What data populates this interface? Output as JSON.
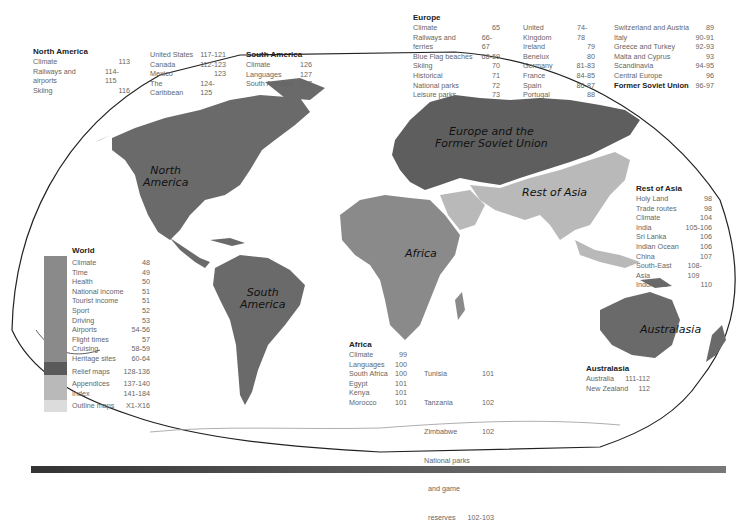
{
  "colors": {
    "region_dark": "#6a6a6a",
    "region_mid": "#8a8a8a",
    "region_light": "#b9b9b9",
    "region_pale": "#d8d8d8",
    "outline": "#222222"
  },
  "map_labels": {
    "north_america": [
      "North",
      "America"
    ],
    "south_america": [
      "South",
      "America"
    ],
    "europe": [
      "Europe and the",
      "Former Soviet Union"
    ],
    "rest_of_asia": "Rest of Asia",
    "africa": "Africa",
    "australasia": "Australasia"
  },
  "north_america": {
    "title": "North America",
    "col1": [
      {
        "label": "Climate",
        "pages": "113"
      },
      {
        "label": "Railways and airports",
        "pages": "114-115"
      },
      {
        "label": "Skiing",
        "pages": "116"
      }
    ],
    "col2": [
      {
        "label": "United States",
        "pages": "117-121"
      },
      {
        "label": "Canada",
        "pages": "112-123"
      },
      {
        "label": "Mexico",
        "pages": "123"
      },
      {
        "label": "The Caribbean",
        "pages": "124-125"
      }
    ]
  },
  "south_america": {
    "title": "South America",
    "items": [
      {
        "label": "Climate",
        "pages": "126"
      },
      {
        "label": "Languages",
        "pages": "127"
      },
      {
        "label": "South America",
        "pages": "127"
      }
    ]
  },
  "europe": {
    "title": "Europe",
    "col1": [
      {
        "label": "Climate",
        "pages": "65"
      },
      {
        "label": "Railways and ferries",
        "pages": "66-67"
      },
      {
        "label": "Blue Flag beaches",
        "pages": "68-69"
      },
      {
        "label": "Skiing",
        "pages": "70"
      },
      {
        "label": "Historical",
        "pages": "71"
      },
      {
        "label": "National parks",
        "pages": "72"
      },
      {
        "label": "Leisure parks",
        "pages": "73"
      }
    ],
    "col2": [
      {
        "label": "United Kingdom",
        "pages": "74-78"
      },
      {
        "label": "Ireland",
        "pages": "79"
      },
      {
        "label": "Benelux",
        "pages": "80"
      },
      {
        "label": "Germany",
        "pages": "81-83"
      },
      {
        "label": "France",
        "pages": "84-85"
      },
      {
        "label": "Spain",
        "pages": "86-87"
      },
      {
        "label": "Portugal",
        "pages": "88"
      }
    ],
    "col3": [
      {
        "label": "Switzerland and Austria",
        "pages": "89"
      },
      {
        "label": "Italy",
        "pages": "90-91"
      },
      {
        "label": "Greece and Turkey",
        "pages": "92-93"
      },
      {
        "label": "Malta and Cyprus",
        "pages": "93"
      },
      {
        "label": "Scandinavia",
        "pages": "94-95"
      },
      {
        "label": "Central Europe",
        "pages": "96"
      }
    ],
    "fsu": {
      "label": "Former Soviet Union",
      "pages": "96-97"
    }
  },
  "world": {
    "title": "World",
    "items": [
      {
        "label": "Climate",
        "pages": "48"
      },
      {
        "label": "Time",
        "pages": "49"
      },
      {
        "label": "Health",
        "pages": "50"
      },
      {
        "label": "National income",
        "pages": "51"
      },
      {
        "label": "Tourist income",
        "pages": "51"
      },
      {
        "label": "Sport",
        "pages": "52"
      },
      {
        "label": "Driving",
        "pages": "53"
      },
      {
        "label": "Airports",
        "pages": "54-56"
      },
      {
        "label": "Flight times",
        "pages": "57"
      },
      {
        "label": "Cruising",
        "pages": "58-59"
      },
      {
        "label": "Heritage sites",
        "pages": "60-64"
      }
    ],
    "relief": {
      "label": "Relief maps",
      "pages": "128-136"
    },
    "appendices": [
      {
        "label": "Appendices",
        "pages": "137-140"
      },
      {
        "label": "Index",
        "pages": "141-184"
      }
    ],
    "outline": {
      "label": "Outline maps",
      "pages": "X1-X16"
    }
  },
  "rest_of_asia": {
    "title": "Rest of Asia",
    "items": [
      {
        "label": "Holy Land",
        "pages": "98"
      },
      {
        "label": "Trade routes",
        "pages": "98"
      },
      {
        "label": "Climate",
        "pages": "104"
      },
      {
        "label": "India",
        "pages": "105-106"
      },
      {
        "label": "Sri Lanka",
        "pages": "106"
      },
      {
        "label": "Indian Ocean",
        "pages": "106"
      },
      {
        "label": "China",
        "pages": "107"
      },
      {
        "label": "South-East Asia",
        "pages": "108-109"
      },
      {
        "label": "Indonesia",
        "pages": "110"
      }
    ]
  },
  "africa": {
    "title": "Africa",
    "col1": [
      {
        "label": "Climate",
        "pages": "99"
      },
      {
        "label": "Languages",
        "pages": "100"
      },
      {
        "label": "South Africa",
        "pages": "100"
      },
      {
        "label": "Egypt",
        "pages": "101"
      },
      {
        "label": "Kenya",
        "pages": "101"
      },
      {
        "label": "Morocco",
        "pages": "101"
      }
    ],
    "col2": [
      {
        "label": "Tunisia",
        "pages": "101"
      },
      {
        "label": "Tanzania",
        "pages": "102"
      },
      {
        "label": "Zimbabwe",
        "pages": "102"
      },
      {
        "label": "National parks",
        "pages": ""
      },
      {
        "label": "  and game",
        "pages": ""
      },
      {
        "label": "  reserves",
        "pages": "102-103"
      }
    ]
  },
  "australasia": {
    "title": "Australasia",
    "items": [
      {
        "label": "Australia",
        "pages": "111-112"
      },
      {
        "label": "New Zealand",
        "pages": "112"
      }
    ]
  }
}
